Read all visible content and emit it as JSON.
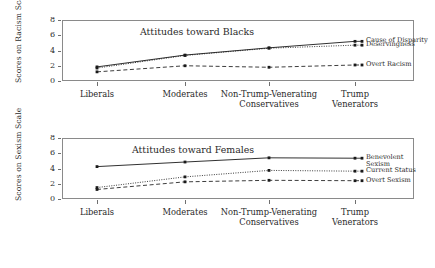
{
  "chart_data": [
    {
      "type": "line",
      "panel_id": "top",
      "title": "Attitudes toward Blacks",
      "xlabel": "",
      "ylabel": "Scores on Racism Scale",
      "ylim": [
        0,
        8
      ],
      "yticks": [
        0,
        2,
        4,
        6,
        8
      ],
      "grid": false,
      "legend_position": "right-inline",
      "categories": [
        "Liberals",
        "Moderates",
        "Non-Trump-Venerating\nConservatives",
        "Trump\nVenerators"
      ],
      "series": [
        {
          "name": "Cause of Disparity",
          "label": "Cause of Disparity",
          "style": "solid",
          "values": [
            1.85,
            3.4,
            4.35,
            5.2
          ]
        },
        {
          "name": "Deservingness",
          "label": "Deservingness",
          "style": "dotted",
          "values": [
            1.7,
            3.35,
            4.3,
            4.7
          ]
        },
        {
          "name": "Overt Racism",
          "label": "Overt Racism",
          "style": "dashed",
          "values": [
            1.2,
            2.0,
            1.8,
            2.1
          ]
        }
      ]
    },
    {
      "type": "line",
      "panel_id": "bottom",
      "title": "Attitudes toward Females",
      "xlabel": "",
      "ylabel": "Scores on Sexism Scale",
      "ylim": [
        0,
        8
      ],
      "yticks": [
        0,
        2,
        4,
        6,
        8
      ],
      "grid": false,
      "legend_position": "right-inline",
      "categories": [
        "Liberals",
        "Moderates",
        "Non-Trump-Venerating\nConservatives",
        "Trump\nVenerators"
      ],
      "series": [
        {
          "name": "Benevolent Sexism",
          "label": "Benevolent\nSexism",
          "style": "solid",
          "values": [
            4.25,
            4.85,
            5.4,
            5.35
          ]
        },
        {
          "name": "Current Status",
          "label": "Current Status",
          "style": "dotted",
          "values": [
            1.5,
            2.9,
            3.75,
            3.65
          ]
        },
        {
          "name": "Overt Sexism",
          "label": "Overt Sexism",
          "style": "dashed",
          "values": [
            1.25,
            2.25,
            2.45,
            2.4
          ]
        }
      ]
    }
  ],
  "colors": {
    "line": "#1a1a1a",
    "axis": "#8a8a8a",
    "text": "#2a2a2a",
    "background": "#ffffff"
  }
}
